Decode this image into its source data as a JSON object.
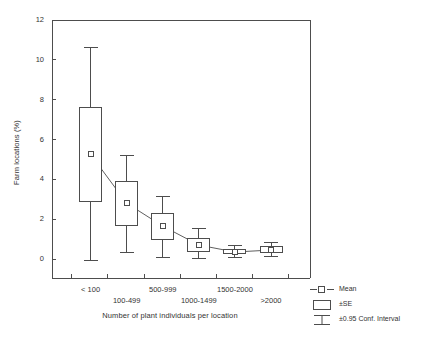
{
  "chart_data": {
    "type": "box",
    "title": "",
    "subtitle": "",
    "xlabel": "Number of plant individuals per location",
    "ylabel": "Farm locations (%)",
    "categories": [
      "< 100",
      "100-499",
      "500-999",
      "1000-1499",
      "1500-2000",
      ">2000"
    ],
    "ylim": [
      0,
      12
    ],
    "ytick_values": [
      0,
      2,
      4,
      6,
      8,
      10,
      12
    ],
    "ytick_labels": [
      "0",
      "2",
      "4",
      "6",
      "8",
      "10",
      "12"
    ],
    "grid": false,
    "legend_position": "outside-bottom-right",
    "series": [
      {
        "name": "Mean",
        "values": [
          5.25,
          2.8,
          1.65,
          0.7,
          0.35,
          0.45
        ]
      },
      {
        "name": "±SE",
        "box_low": [
          2.9,
          1.7,
          1.0,
          0.4,
          0.3,
          0.35
        ],
        "box_high": [
          7.6,
          3.9,
          2.3,
          1.05,
          0.5,
          0.65
        ]
      },
      {
        "name": "±0.95 Conf. Interval",
        "whisker_low": [
          -0.1,
          0.35,
          0.1,
          0.05,
          0.1,
          0.15
        ],
        "whisker_high": [
          10.6,
          5.2,
          3.15,
          1.55,
          0.7,
          0.85
        ]
      }
    ],
    "legend": [
      {
        "label": "Mean",
        "key": "line-marker-square"
      },
      {
        "label": "±SE",
        "key": "box-rect"
      },
      {
        "label": "±0.95 Conf. Interval",
        "key": "error-bar"
      }
    ],
    "colors": {
      "axis": "#4d4d4d",
      "series": "#4d4d4d",
      "text": "#333333",
      "background": "#ffffff"
    }
  }
}
